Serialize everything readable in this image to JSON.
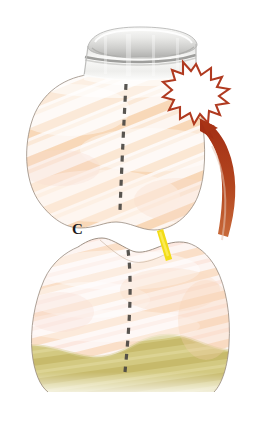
{
  "figure": {
    "domain_description": "Dental illustration of two opposing teeth, upper tooth fitted with a metallic band, showing occlusal interference",
    "width": 263,
    "height": 433,
    "background_color": "#ffffff"
  },
  "labels": [
    {
      "id": "contact-point-label",
      "text": "C",
      "x": 77,
      "y": 229,
      "color": "#1a1a1a",
      "description": "letter label marking the contact point between upper and lower teeth"
    }
  ],
  "annotations": {
    "starburst": {
      "name": "pain-starburst",
      "center_x": 196,
      "center_y": 88,
      "outer_radius": 24,
      "inner_radius": 14,
      "points": 16,
      "stroke_color": "#b03a20",
      "fill_color": "#ffffff",
      "description": "jagged explosion/pain burst symbol on the upper right of the upper tooth"
    },
    "arrow": {
      "name": "force-direction-arrow",
      "color": "#a32f15",
      "description": "curved arrow sweeping upward and to the left toward the starburst, indicating direction of applied force",
      "tip_x": 203,
      "tip_y": 122,
      "tail_x": 229,
      "tail_y": 236
    },
    "highlight_marker": {
      "name": "yellow-highlight-marker",
      "color": "#f5e019",
      "description": "short bright yellow diagonal stroke marking the interference site on the lower tooth cusp",
      "x1": 161,
      "y1": 232,
      "x2": 168,
      "y2": 258
    },
    "midline_upper": {
      "name": "upper-tooth-midline",
      "color": "#4a4642",
      "style": "dashed",
      "description": "dashed vertical midline through the upper tooth"
    },
    "midline_lower": {
      "name": "lower-tooth-midline",
      "color": "#4a4642",
      "style": "dashed",
      "description": "dashed vertical midline through the lower tooth and root"
    }
  },
  "anatomy": {
    "metal_band": {
      "name": "metal-band",
      "description": "metallic orthodontic / crown band encircling the upper tooth near its base",
      "color_light": "#f2f2f0",
      "color_mid": "#d4d4d2",
      "color_dark": "#9a9a98",
      "outline": "#a8a8a6"
    },
    "upper_tooth": {
      "name": "upper-tooth",
      "description": "upper tooth crown with peach enamel striations",
      "fill_base": "#fdf3ec",
      "stripe_color": "#f5c79a",
      "outline": "#8a7f74"
    },
    "lower_tooth": {
      "name": "lower-tooth",
      "description": "lower tooth crown with peach-pink enamel striations",
      "fill_base": "#fdf2ee",
      "stripe_color": "#f7cfae",
      "outline": "#8a7f74"
    },
    "root_bone": {
      "name": "root-bone-band",
      "description": "olive / khaki band at the base representing root or bone",
      "fill": "#cfc477",
      "stripe_color": "#b8ab5c"
    }
  },
  "colors": {
    "background": "#ffffff",
    "enamel_peach": "#f5c79a",
    "enamel_pink": "#f8d5cf",
    "burst_red": "#b03a20",
    "arrow_red": "#a32f15",
    "marker_yellow": "#f5e019",
    "bone_olive": "#cfc477",
    "dash_gray": "#4a4642",
    "band_gray": "#d4d4d2"
  }
}
